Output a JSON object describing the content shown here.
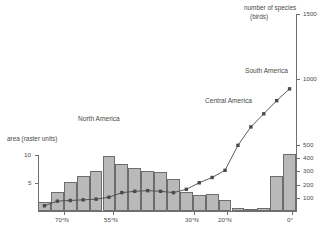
{
  "chart_data": {
    "type": "bar",
    "title": "",
    "xlabel": "",
    "left_axis": {
      "label": "area (raster units)",
      "ticks": [
        5,
        10
      ],
      "range": [
        0,
        11.2
      ],
      "unit": "raster units"
    },
    "right_axis": {
      "label_line1": "number of species",
      "label_line2": "(birds)",
      "ticks": [
        100,
        200,
        300,
        400,
        500,
        1000,
        1500
      ],
      "range": [
        0,
        1500
      ]
    },
    "x_tick_labels": [
      "70°N",
      "55°N",
      "30°N",
      "20°N",
      "0°"
    ],
    "x_tick_degrees": [
      70,
      55,
      30,
      20,
      0
    ],
    "x_range_degrees": [
      78,
      -2
    ],
    "annotations": [
      {
        "text": "North America",
        "region": "north-america"
      },
      {
        "text": "Central America",
        "region": "central-america"
      },
      {
        "text": "South America",
        "region": "south-america"
      }
    ],
    "categories": [
      "75°N",
      "71°N",
      "67°N",
      "63°N",
      "59°N",
      "55°N",
      "51°N",
      "47°N",
      "43°N",
      "39°N",
      "35°N",
      "31°N",
      "27°N",
      "23°N",
      "19°N",
      "15°N",
      "11°N",
      "7°N",
      "3°N",
      "1°S"
    ],
    "series": [
      {
        "name": "area (raster units)",
        "type": "bar",
        "axis": "left",
        "color": "#b9b9b9",
        "values": [
          1.6,
          3.4,
          5.1,
          6.3,
          7.1,
          9.9,
          8.4,
          7.6,
          7.1,
          7.0,
          5.7,
          3.4,
          2.8,
          3.1,
          1.9,
          0.45,
          0.4,
          0.55,
          6.2,
          10.2
        ]
      },
      {
        "name": "number of species (birds)",
        "type": "line",
        "axis": "right",
        "color": "#4a4a4a",
        "marker": "square",
        "values": [
          40,
          75,
          80,
          85,
          90,
          105,
          140,
          150,
          155,
          150,
          140,
          165,
          215,
          255,
          310,
          500,
          640,
          740,
          840,
          930
        ]
      }
    ],
    "grid": false,
    "legend": "none"
  }
}
